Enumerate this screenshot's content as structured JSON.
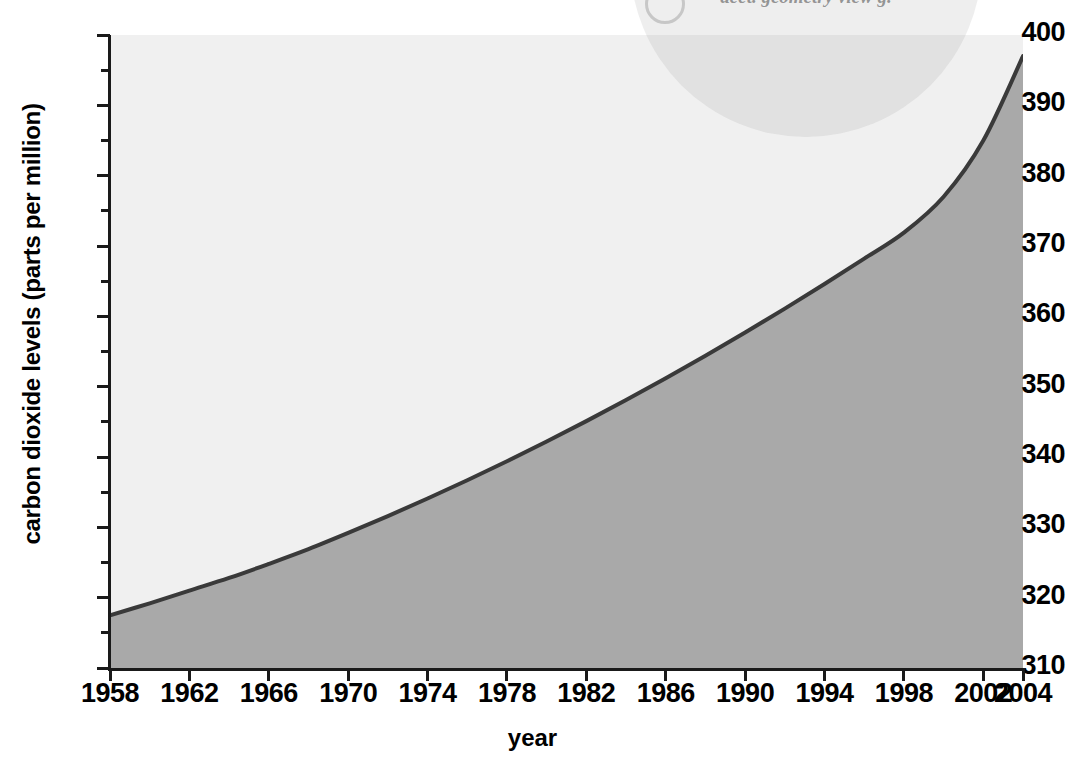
{
  "chart_data": {
    "type": "area",
    "title": "",
    "xlabel": "year",
    "ylabel": "carbon dioxide levels (parts per million)",
    "xlim": [
      1958,
      2004
    ],
    "ylim": [
      310,
      400
    ],
    "grid": false,
    "legend": null,
    "x_tick_labels": [
      "1958",
      "1962",
      "1966",
      "1970",
      "1974",
      "1978",
      "1982",
      "1986",
      "1990",
      "1994",
      "1998",
      "2002",
      "2004"
    ],
    "x_tick_values": [
      1958,
      1962,
      1966,
      1970,
      1974,
      1978,
      1982,
      1986,
      1990,
      1994,
      1998,
      2002,
      2004
    ],
    "y_tick_labels": [
      "310",
      "320",
      "330",
      "340",
      "350",
      "360",
      "370",
      "380",
      "390",
      "400"
    ],
    "y_tick_values": [
      310,
      320,
      330,
      340,
      350,
      360,
      370,
      380,
      390,
      400
    ],
    "y_minor_tick_values": [
      315,
      325,
      335,
      345,
      355,
      365,
      375,
      385,
      395
    ],
    "series": [
      {
        "name": "carbon dioxide levels",
        "x": [
          1958,
          1960,
          1962,
          1964,
          1966,
          1968,
          1970,
          1972,
          1974,
          1976,
          1978,
          1980,
          1982,
          1984,
          1986,
          1988,
          1990,
          1992,
          1994,
          1996,
          1998,
          2000,
          2002,
          2004
        ],
        "values": [
          317.5,
          319.2,
          321.0,
          322.8,
          324.8,
          326.9,
          329.2,
          331.6,
          334.1,
          336.7,
          339.4,
          342.2,
          345.1,
          348.1,
          351.2,
          354.4,
          357.7,
          361.1,
          364.6,
          368.2,
          371.9,
          377.0,
          385.0,
          397.0
        ]
      }
    ],
    "colors": {
      "line": "#3a3a3a",
      "fill_below": "#a9a9a9",
      "fill_above": "#f0f0f0",
      "axis": "#1a1a1a",
      "text": "#000000"
    }
  },
  "watermark": {
    "text": "acct. geometry view g.",
    "badge_icon": "circle-badge-icon"
  }
}
